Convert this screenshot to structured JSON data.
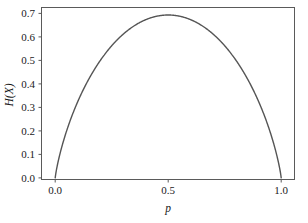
{
  "chart_data": {
    "type": "line",
    "title": "",
    "subtitle": "",
    "xlabel": "p",
    "ylabel": "H(X)",
    "xlim": [
      -0.02,
      1.02
    ],
    "ylim": [
      -0.02,
      0.72
    ],
    "xticks": [
      0.0,
      0.5,
      1.0
    ],
    "xtick_labels": [
      "0.0",
      "0.5",
      "1.0"
    ],
    "yticks": [
      0.0,
      0.1,
      0.2,
      0.3,
      0.4,
      0.5,
      0.6,
      0.7
    ],
    "ytick_labels": [
      "0.0",
      "0.1",
      "0.2",
      "0.3",
      "0.4",
      "0.5",
      "0.6",
      "0.7"
    ],
    "grid": false,
    "legend": false,
    "legend_position": "none",
    "annotations": [],
    "series": [
      {
        "name": "binary entropy H(X) = -p ln p - (1-p) ln(1-p)",
        "color": "#555555",
        "line_width": 1.4,
        "x": [
          0.0,
          0.005,
          0.01,
          0.02,
          0.03,
          0.04,
          0.05,
          0.06,
          0.08,
          0.1,
          0.12,
          0.14,
          0.16,
          0.18,
          0.2,
          0.22,
          0.25,
          0.28,
          0.3,
          0.32,
          0.35,
          0.38,
          0.4,
          0.42,
          0.45,
          0.48,
          0.5,
          0.52,
          0.55,
          0.58,
          0.6,
          0.62,
          0.65,
          0.68,
          0.7,
          0.72,
          0.75,
          0.78,
          0.8,
          0.82,
          0.84,
          0.86,
          0.88,
          0.9,
          0.92,
          0.94,
          0.95,
          0.96,
          0.97,
          0.98,
          0.99,
          0.995,
          1.0
        ],
        "y": [
          0.0,
          0.0315,
          0.056,
          0.0983,
          0.1361,
          0.171,
          0.1985,
          0.2321,
          0.283,
          0.3251,
          0.3612,
          0.3926,
          0.4203,
          0.4448,
          0.5004,
          0.5281,
          0.5623,
          0.592,
          0.6109,
          0.6254,
          0.6474,
          0.664,
          0.673,
          0.6803,
          0.6881,
          0.6923,
          0.6931,
          0.6923,
          0.6881,
          0.6803,
          0.673,
          0.664,
          0.6474,
          0.6254,
          0.6109,
          0.592,
          0.5623,
          0.5281,
          0.5004,
          0.4691,
          0.4448,
          0.4203,
          0.3926,
          0.3251,
          0.283,
          0.2321,
          0.1985,
          0.171,
          0.1361,
          0.0983,
          0.056,
          0.0315,
          0.0
        ]
      }
    ],
    "peak": {
      "x": 0.5,
      "y": 0.693
    },
    "colors": {
      "curve": "#555555",
      "axis": "#5a5a5a",
      "text": "#1a1a1a",
      "background": "#ffffff"
    }
  }
}
